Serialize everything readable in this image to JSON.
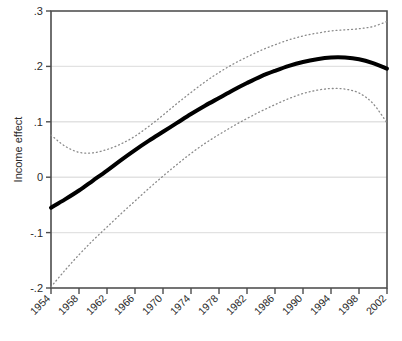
{
  "chart_data": {
    "type": "line",
    "title": "",
    "subtitle": "",
    "xlabel": "",
    "ylabel": "Income effect",
    "xlim": [
      1954,
      2002
    ],
    "ylim": [
      -0.2,
      0.3
    ],
    "grid": true,
    "grid_axis": "y",
    "legend": false,
    "legend_position": "none",
    "x_tick_labels": [
      "1954",
      "1958",
      "1962",
      "1966",
      "1970",
      "1974",
      "1978",
      "1982",
      "1986",
      "1990",
      "1994",
      "1998",
      "2002"
    ],
    "x_tick_values": [
      1954,
      1958,
      1962,
      1966,
      1970,
      1974,
      1978,
      1982,
      1986,
      1990,
      1994,
      1998,
      2002
    ],
    "x_tick_rotation": 45,
    "y_tick_labels": [
      ".3",
      ".2",
      ".1",
      "0",
      "-.1",
      "-.2"
    ],
    "y_tick_values": [
      0.3,
      0.2,
      0.1,
      0,
      -0.1,
      -0.2
    ],
    "x": [
      1954,
      1956,
      1958,
      1960,
      1962,
      1964,
      1966,
      1968,
      1970,
      1972,
      1974,
      1976,
      1978,
      1980,
      1982,
      1984,
      1986,
      1988,
      1990,
      1992,
      1994,
      1996,
      1998,
      2000,
      2002
    ],
    "series": [
      {
        "name": "Income effect (estimate)",
        "style": "solid",
        "color": "#000000",
        "width": 4,
        "values": [
          -0.055,
          -0.04,
          -0.024,
          -0.006,
          0.012,
          0.031,
          0.049,
          0.066,
          0.082,
          0.098,
          0.114,
          0.129,
          0.143,
          0.157,
          0.17,
          0.182,
          0.192,
          0.201,
          0.208,
          0.213,
          0.216,
          0.216,
          0.213,
          0.206,
          0.196
        ]
      },
      {
        "name": "Upper confidence bound",
        "style": "dotted",
        "color": "#8a8a8a",
        "width": 1.3,
        "values": [
          0.076,
          0.056,
          0.045,
          0.044,
          0.05,
          0.06,
          0.074,
          0.092,
          0.112,
          0.133,
          0.153,
          0.172,
          0.189,
          0.204,
          0.217,
          0.229,
          0.239,
          0.248,
          0.255,
          0.26,
          0.264,
          0.266,
          0.268,
          0.272,
          0.281
        ]
      },
      {
        "name": "Lower confidence bound",
        "style": "dotted",
        "color": "#8a8a8a",
        "width": 1.3,
        "values": [
          -0.198,
          -0.168,
          -0.14,
          -0.114,
          -0.09,
          -0.066,
          -0.043,
          -0.02,
          0.002,
          0.023,
          0.043,
          0.061,
          0.077,
          0.092,
          0.106,
          0.119,
          0.131,
          0.142,
          0.151,
          0.157,
          0.16,
          0.159,
          0.152,
          0.133,
          0.098
        ]
      }
    ],
    "colors": {
      "estimate": "#000000",
      "confidence_band": "#8a8a8a",
      "gridline": "#e2e2e2",
      "frame": "#4d4d4d",
      "background": "#ffffff"
    }
  }
}
